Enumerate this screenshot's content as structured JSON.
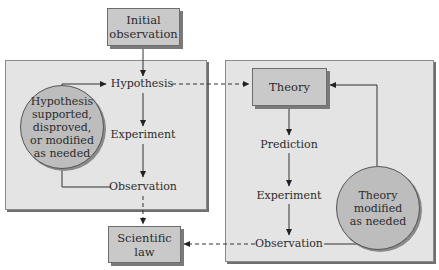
{
  "diagram": {
    "nodes": {
      "initial_observation": "Initial\nobservation",
      "hypothesis": "Hypothesis",
      "hypothesis_cycle": "Hypothesis supported, disproved, or modified as needed",
      "experiment_left": "Experiment",
      "observation_left": "Observation",
      "scientific_law": "Scientific\nlaw",
      "theory": "Theory",
      "prediction": "Prediction",
      "experiment_right": "Experiment",
      "observation_right": "Observation",
      "theory_cycle": "Theory modified as needed"
    },
    "edges": [
      {
        "from": "Initial observation",
        "to": "Hypothesis",
        "style": "solid"
      },
      {
        "from": "Hypothesis",
        "to": "Experiment",
        "style": "solid"
      },
      {
        "from": "Experiment",
        "to": "Observation",
        "style": "solid"
      },
      {
        "from": "Observation",
        "to": "Hypothesis",
        "style": "solid",
        "via": "Hypothesis supported, disproved, or modified as needed"
      },
      {
        "from": "Hypothesis",
        "to": "Theory",
        "style": "dashed"
      },
      {
        "from": "Observation",
        "to": "Scientific law",
        "style": "dashed"
      },
      {
        "from": "Theory",
        "to": "Prediction",
        "style": "solid"
      },
      {
        "from": "Prediction",
        "to": "Experiment",
        "style": "solid"
      },
      {
        "from": "Experiment",
        "to": "Observation",
        "style": "solid"
      },
      {
        "from": "Observation",
        "to": "Theory",
        "style": "solid",
        "via": "Theory modified as needed"
      },
      {
        "from": "Observation",
        "to": "Scientific law",
        "style": "dashed"
      }
    ],
    "colors": {
      "panel": "#e4e4e4",
      "box": "#c9c9c9",
      "circle": "#bdbdbd",
      "line": "#333333"
    }
  }
}
